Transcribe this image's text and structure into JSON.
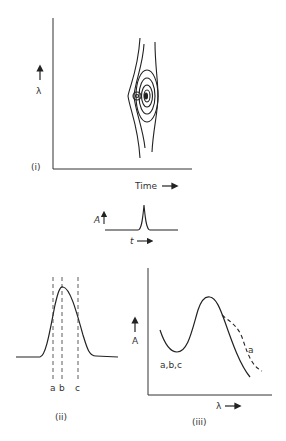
{
  "panels": {
    "i": {
      "label": "(i)",
      "y_axis_label": "λ",
      "x_axis_label": "Time",
      "description": "contour plot of absorbance over wavelength and time, showing two overlapping components"
    },
    "inset": {
      "y_axis_label": "A",
      "x_axis_label": "t",
      "description": "single chromatographic peak"
    },
    "ii": {
      "label": "(ii)",
      "markers": [
        "a",
        "b",
        "c"
      ],
      "description": "chromatographic peak with three dashed time markers"
    },
    "iii": {
      "label": "(iii)",
      "y_axis_label": "A",
      "x_axis_label": "λ",
      "curve_labels": [
        "a,b,c",
        "a"
      ],
      "description": "spectra at times a, b, c; spectrum a deviates on long-wavelength side (dashed)"
    }
  },
  "colors": {
    "ink": "#222222",
    "background": "#ffffff"
  }
}
